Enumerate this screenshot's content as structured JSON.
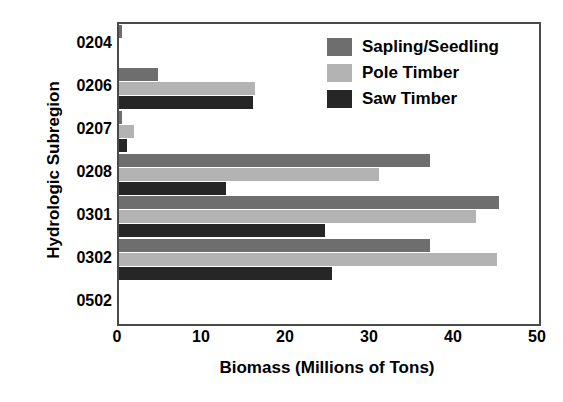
{
  "chart_data": {
    "type": "bar",
    "orientation": "horizontal",
    "title": "",
    "xlabel": "Biomass (Millions of Tons)",
    "ylabel": "Hydrologic Subregion",
    "categories": [
      "0204",
      "0206",
      "0207",
      "0208",
      "0301",
      "0302",
      "0502"
    ],
    "xlim": [
      0,
      50
    ],
    "xticks": [
      0,
      10,
      20,
      30,
      40,
      50
    ],
    "xtick_labels": [
      "0",
      "10",
      "20",
      "30",
      "40",
      "50"
    ],
    "grid": false,
    "legend_position": "upper right",
    "series": [
      {
        "name": "Sapling/Seedling",
        "color": "#6e6e6e",
        "values": [
          0.3,
          4.7,
          0.3,
          37.0,
          45.2,
          37.0,
          0.0
        ]
      },
      {
        "name": "Pole Timber",
        "color": "#b3b3b3",
        "values": [
          0.0,
          16.2,
          1.8,
          31.0,
          42.5,
          45.0,
          0.0
        ]
      },
      {
        "name": "Saw Timber",
        "color": "#262626",
        "values": [
          0.0,
          16.0,
          1.0,
          12.7,
          24.5,
          25.3,
          0.0
        ]
      }
    ]
  }
}
